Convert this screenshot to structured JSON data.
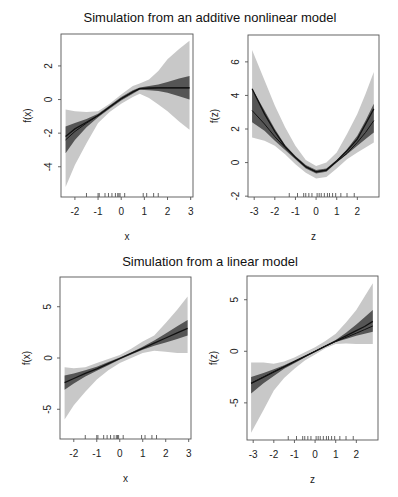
{
  "titles": {
    "top": "Simulation from an additive nonlinear model",
    "bottom": "Simulation from a linear model"
  },
  "colors": {
    "outer_band": "#c8c8c8",
    "inner_band": "#555555",
    "line": "#111111",
    "frame": "#555555"
  },
  "chart_data": [
    {
      "type": "area",
      "title": "Simulation from an additive nonlinear model",
      "xlabel": "x",
      "ylabel": "f(x)",
      "xlim": [
        -2.6,
        3.1
      ],
      "ylim": [
        -5.8,
        3.9
      ],
      "xticks": [
        -2,
        -1,
        0,
        1,
        2,
        3
      ],
      "yticks": [
        -4,
        -2,
        0,
        2
      ],
      "grid": false,
      "x": [
        -2.4,
        -2.0,
        -1.5,
        -1.0,
        -0.5,
        0.0,
        0.5,
        0.8,
        1.2,
        1.6,
        2.0,
        2.5,
        2.95
      ],
      "series": [
        {
          "name": "fit",
          "values": [
            -2.2,
            -1.75,
            -1.35,
            -0.95,
            -0.45,
            0.05,
            0.45,
            0.65,
            0.68,
            0.7,
            0.7,
            0.7,
            0.7
          ]
        },
        {
          "name": "fit_alt",
          "values": [
            -2.4,
            -1.9,
            -1.4,
            -0.95,
            -0.45,
            0.05,
            0.45,
            0.65,
            0.68,
            0.7,
            0.7,
            0.7,
            0.7
          ]
        },
        {
          "name": "inner_upper",
          "values": [
            -1.6,
            -1.4,
            -1.15,
            -0.85,
            -0.35,
            0.15,
            0.55,
            0.72,
            0.8,
            0.9,
            1.05,
            1.25,
            1.4
          ]
        },
        {
          "name": "inner_lower",
          "values": [
            -3.2,
            -2.4,
            -1.65,
            -1.05,
            -0.55,
            -0.05,
            0.35,
            0.58,
            0.55,
            0.5,
            0.4,
            0.2,
            0.0
          ]
        },
        {
          "name": "outer_upper",
          "values": [
            -0.6,
            -0.7,
            -0.75,
            -0.7,
            -0.25,
            0.3,
            0.8,
            0.95,
            1.2,
            1.7,
            2.4,
            3.0,
            3.5
          ]
        },
        {
          "name": "outer_lower",
          "values": [
            -5.2,
            -3.9,
            -2.6,
            -1.4,
            -0.75,
            -0.25,
            0.15,
            0.35,
            0.1,
            -0.3,
            -0.7,
            -1.3,
            -1.8
          ]
        }
      ],
      "rug": [
        -1.5,
        -1.0,
        -0.95,
        -0.7,
        -0.55,
        -0.4,
        -0.25,
        -0.15,
        -0.1,
        -0.05,
        0.15,
        0.95,
        1.1,
        1.4,
        1.6
      ]
    },
    {
      "type": "area",
      "title": "",
      "xlabel": "z",
      "ylabel": "f(z)",
      "xlim": [
        -3.3,
        3.05
      ],
      "ylim": [
        -2.05,
        7.6
      ],
      "xticks": [
        -3,
        -2,
        -1,
        0,
        1,
        2
      ],
      "yticks": [
        -2,
        0,
        2,
        4,
        6
      ],
      "grid": false,
      "x": [
        -3.1,
        -2.5,
        -2.0,
        -1.5,
        -1.0,
        -0.5,
        0.0,
        0.5,
        1.0,
        1.5,
        2.0,
        2.4,
        2.8
      ],
      "series": [
        {
          "name": "fit",
          "values": [
            4.4,
            2.9,
            1.85,
            0.95,
            0.3,
            -0.25,
            -0.55,
            -0.45,
            0.1,
            0.7,
            1.4,
            2.3,
            3.2
          ]
        },
        {
          "name": "fit_alt",
          "values": [
            3.1,
            2.3,
            1.55,
            0.9,
            0.3,
            -0.25,
            -0.55,
            -0.45,
            0.05,
            0.55,
            1.2,
            1.8,
            2.5
          ]
        },
        {
          "name": "inner_upper",
          "values": [
            4.4,
            3.1,
            2.0,
            1.05,
            0.4,
            -0.15,
            -0.45,
            -0.35,
            0.15,
            0.8,
            1.6,
            2.5,
            3.5
          ]
        },
        {
          "name": "inner_lower",
          "values": [
            2.4,
            1.9,
            1.3,
            0.75,
            0.2,
            -0.35,
            -0.65,
            -0.55,
            0.0,
            0.5,
            1.0,
            1.4,
            1.8
          ]
        },
        {
          "name": "outer_upper",
          "values": [
            6.7,
            4.9,
            3.4,
            2.1,
            1.0,
            0.15,
            -0.2,
            0.0,
            0.6,
            1.7,
            2.9,
            4.1,
            5.4
          ]
        },
        {
          "name": "outer_lower",
          "values": [
            1.5,
            1.3,
            1.0,
            0.5,
            -0.1,
            -0.6,
            -0.95,
            -0.85,
            -0.35,
            0.2,
            0.6,
            0.9,
            1.2
          ]
        }
      ],
      "rug": [
        -1.3,
        -0.9,
        -0.6,
        -0.5,
        -0.35,
        -0.2,
        0.05,
        0.15,
        0.25,
        0.4,
        0.55,
        0.65,
        0.8,
        0.95,
        1.2,
        1.5,
        1.85
      ]
    },
    {
      "type": "area",
      "title": "Simulation from a linear model",
      "xlabel": "x",
      "ylabel": "f(x)",
      "xlim": [
        -2.6,
        3.1
      ],
      "ylim": [
        -7.9,
        7.9
      ],
      "xticks": [
        -2,
        -1,
        0,
        1,
        2,
        3
      ],
      "yticks": [
        -5,
        0,
        5
      ],
      "grid": false,
      "x": [
        -2.4,
        -2.0,
        -1.5,
        -1.0,
        -0.5,
        0.0,
        0.5,
        1.0,
        1.5,
        2.0,
        2.5,
        2.95
      ],
      "series": [
        {
          "name": "fit",
          "values": [
            -2.4,
            -2.0,
            -1.5,
            -1.05,
            -0.55,
            -0.05,
            0.45,
            0.95,
            1.45,
            1.95,
            2.45,
            2.9
          ]
        },
        {
          "name": "inner_upper",
          "values": [
            -1.7,
            -1.5,
            -1.2,
            -0.85,
            -0.4,
            0.05,
            0.55,
            1.1,
            1.7,
            2.4,
            3.1,
            3.7
          ]
        },
        {
          "name": "inner_lower",
          "values": [
            -3.1,
            -2.5,
            -1.8,
            -1.25,
            -0.7,
            -0.15,
            0.35,
            0.8,
            1.2,
            1.5,
            1.85,
            2.2
          ]
        },
        {
          "name": "outer_upper",
          "values": [
            -0.9,
            -1.0,
            -0.9,
            -0.5,
            -0.1,
            0.3,
            0.9,
            1.6,
            2.2,
            3.4,
            4.7,
            6.0
          ]
        },
        {
          "name": "outer_lower",
          "values": [
            -6.0,
            -4.6,
            -3.3,
            -2.1,
            -1.2,
            -0.5,
            0.0,
            0.5,
            0.7,
            0.6,
            0.5,
            0.5
          ]
        }
      ],
      "rug": [
        -1.5,
        -1.0,
        -0.95,
        -0.7,
        -0.55,
        -0.4,
        -0.25,
        -0.15,
        -0.1,
        -0.05,
        0.15,
        0.95,
        1.1,
        1.4,
        1.6
      ]
    },
    {
      "type": "area",
      "title": "",
      "xlabel": "z",
      "ylabel": "f(z)",
      "xlim": [
        -3.3,
        3.05
      ],
      "ylim": [
        -8.6,
        7.3
      ],
      "xticks": [
        -3,
        -2,
        -1,
        0,
        1,
        2
      ],
      "yticks": [
        -5,
        0,
        5
      ],
      "grid": false,
      "x": [
        -3.1,
        -2.5,
        -2.0,
        -1.5,
        -1.0,
        -0.5,
        0.0,
        0.5,
        1.0,
        1.5,
        2.0,
        2.4,
        2.8
      ],
      "series": [
        {
          "name": "fit",
          "values": [
            -3.1,
            -2.5,
            -2.0,
            -1.5,
            -1.0,
            -0.5,
            0.0,
            0.5,
            1.0,
            1.5,
            2.0,
            2.4,
            2.9
          ]
        },
        {
          "name": "fit_alt",
          "values": [
            -3.1,
            -2.5,
            -2.0,
            -1.5,
            -1.0,
            -0.5,
            0.0,
            0.5,
            0.95,
            1.35,
            1.75,
            2.1,
            2.45
          ]
        },
        {
          "name": "inner_upper",
          "values": [
            -2.5,
            -2.1,
            -1.75,
            -1.35,
            -0.9,
            -0.4,
            0.05,
            0.55,
            1.1,
            1.8,
            2.6,
            3.3,
            4.0
          ]
        },
        {
          "name": "inner_lower",
          "values": [
            -4.1,
            -3.1,
            -2.4,
            -1.7,
            -1.15,
            -0.6,
            -0.05,
            0.45,
            0.9,
            1.2,
            1.5,
            1.7,
            1.9
          ]
        },
        {
          "name": "outer_upper",
          "values": [
            -1.1,
            -1.1,
            -1.2,
            -1.0,
            -0.6,
            -0.1,
            0.4,
            1.0,
            1.7,
            2.8,
            4.0,
            5.3,
            6.6
          ]
        },
        {
          "name": "outer_lower",
          "values": [
            -7.9,
            -5.7,
            -3.8,
            -2.6,
            -1.7,
            -0.9,
            -0.3,
            0.3,
            0.7,
            0.75,
            0.7,
            0.7,
            0.7
          ]
        }
      ],
      "rug": [
        -1.3,
        -0.9,
        -0.6,
        -0.5,
        -0.35,
        -0.2,
        0.05,
        0.15,
        0.25,
        0.4,
        0.55,
        0.65,
        0.8,
        0.95,
        1.2,
        1.5,
        1.85
      ]
    }
  ]
}
